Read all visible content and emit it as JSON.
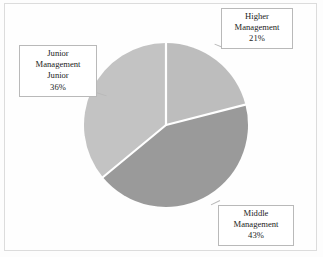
{
  "figure": {
    "background_color": "#fefefe",
    "frame_color": "#dcdcdc",
    "divider_color": "#ffffff"
  },
  "chart_data": {
    "type": "pie",
    "title": "",
    "labels": [
      "Higher Management",
      "Middle Management",
      "Junior Management Junior"
    ],
    "values": [
      21,
      43,
      36
    ],
    "value_unit": "%",
    "colors": [
      "#bdbdbd",
      "#9a9a9a",
      "#c3c3c3"
    ],
    "start_angle_deg": 90,
    "direction": "clockwise",
    "legend": "none",
    "data_labels_position": "callout-boxes",
    "slices": [
      {
        "name": "Higher Management",
        "value": 21,
        "percent_text": "21%",
        "color": "#bdbdbd",
        "callout_lines": [
          "Higher",
          "Management",
          "21%"
        ],
        "callout_position": "top-right"
      },
      {
        "name": "Middle Management",
        "value": 43,
        "percent_text": "43%",
        "color": "#9a9a9a",
        "callout_lines": [
          "Middle",
          "Management",
          "43%"
        ],
        "callout_position": "bottom-right"
      },
      {
        "name": "Junior Management Junior",
        "value": 36,
        "percent_text": "36%",
        "color": "#c3c3c3",
        "callout_lines": [
          "Junior",
          "Management",
          "Junior",
          "36%"
        ],
        "callout_position": "left"
      }
    ]
  },
  "labels": {
    "higher": {
      "line1": "Higher",
      "line2": "Management",
      "line3": "21%"
    },
    "middle": {
      "line1": "Middle",
      "line2": "Management",
      "line3": "43%"
    },
    "junior": {
      "line1": "Junior",
      "line2": "Management",
      "line3": "Junior",
      "line4": "36%"
    }
  }
}
